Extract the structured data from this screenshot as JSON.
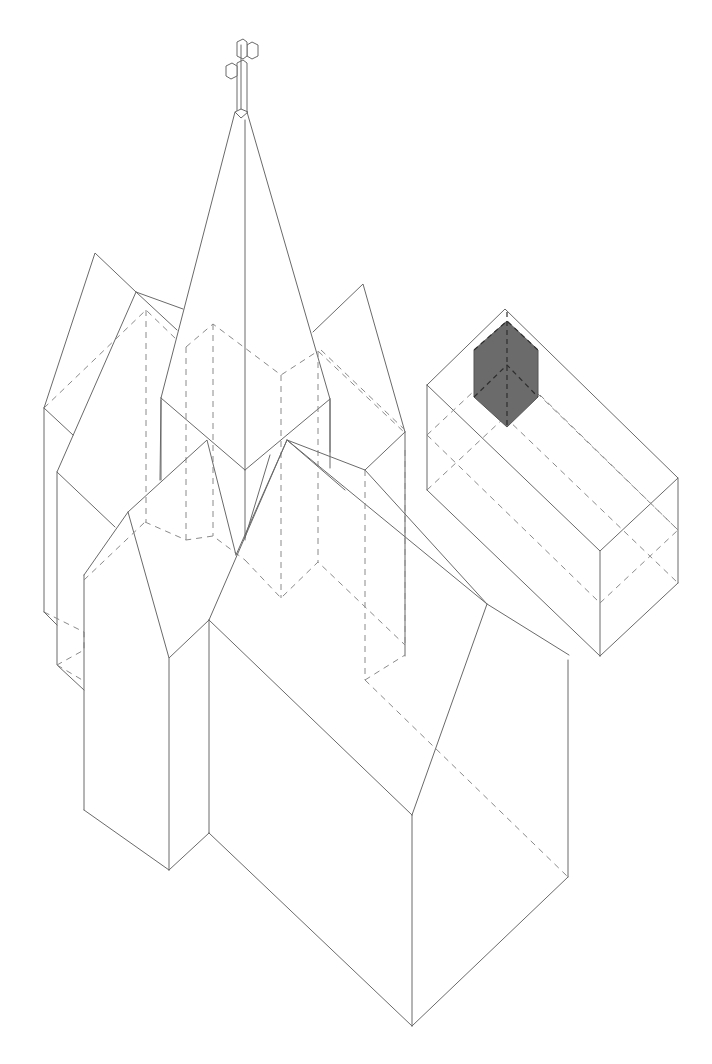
{
  "figure": {
    "line_color": "#6a6a6a",
    "hidden_line_color": "#8a8a8a",
    "highlight_fill": "#6b6b6b",
    "background": "#ffffff"
  },
  "elements": {
    "cross": "cross-on-spire",
    "spire": "central-spire",
    "left_tower": "left-gabled-tower",
    "right_tower": "right-gabled-tower",
    "nave": "main-nave-block",
    "porch": "front-porch-block",
    "detached_block": "detached-rectangular-block",
    "highlight": "shaded-hexagonal-prism"
  }
}
